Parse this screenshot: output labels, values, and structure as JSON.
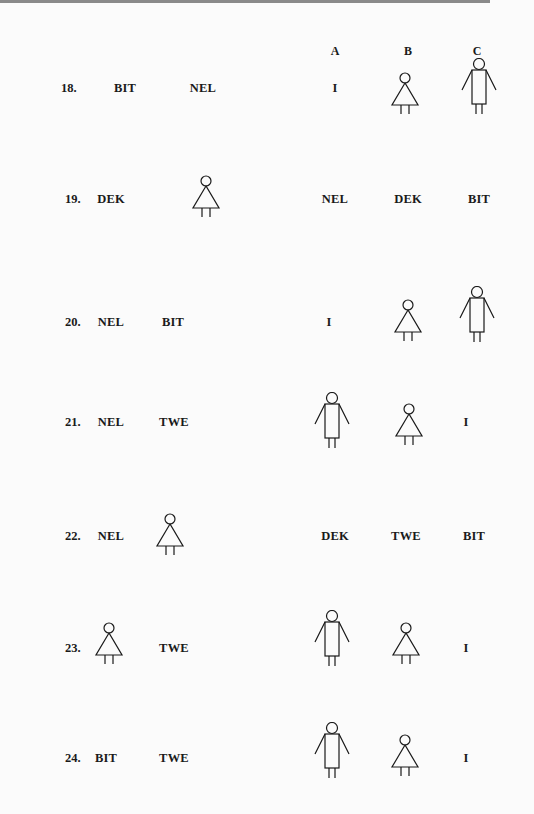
{
  "columns": [
    "A",
    "B",
    "C"
  ],
  "items": [
    {
      "number": "18.",
      "prompt": [
        {
          "type": "text",
          "value": "BIT"
        },
        {
          "type": "text",
          "value": "NEL"
        }
      ],
      "options": [
        {
          "type": "text",
          "value": "I"
        },
        {
          "type": "icon",
          "value": "female-figure"
        },
        {
          "type": "icon",
          "value": "male-figure"
        }
      ]
    },
    {
      "number": "19.",
      "prompt": [
        {
          "type": "text",
          "value": "DEK"
        },
        {
          "type": "icon",
          "value": "female-figure"
        }
      ],
      "options": [
        {
          "type": "text",
          "value": "NEL"
        },
        {
          "type": "text",
          "value": "DEK"
        },
        {
          "type": "text",
          "value": "BIT"
        }
      ]
    },
    {
      "number": "20.",
      "prompt": [
        {
          "type": "text",
          "value": "NEL"
        },
        {
          "type": "text",
          "value": "BIT"
        }
      ],
      "options": [
        {
          "type": "text",
          "value": "I"
        },
        {
          "type": "icon",
          "value": "female-figure"
        },
        {
          "type": "icon",
          "value": "male-figure"
        }
      ]
    },
    {
      "number": "21.",
      "prompt": [
        {
          "type": "text",
          "value": "NEL"
        },
        {
          "type": "text",
          "value": "TWE"
        }
      ],
      "options": [
        {
          "type": "icon",
          "value": "male-figure"
        },
        {
          "type": "icon",
          "value": "female-figure"
        },
        {
          "type": "text",
          "value": "I"
        }
      ]
    },
    {
      "number": "22.",
      "prompt": [
        {
          "type": "text",
          "value": "NEL"
        },
        {
          "type": "icon",
          "value": "female-figure"
        }
      ],
      "options": [
        {
          "type": "text",
          "value": "DEK"
        },
        {
          "type": "text",
          "value": "TWE"
        },
        {
          "type": "text",
          "value": "BIT"
        }
      ]
    },
    {
      "number": "23.",
      "prompt": [
        {
          "type": "icon",
          "value": "female-figure"
        },
        {
          "type": "text",
          "value": "TWE"
        }
      ],
      "options": [
        {
          "type": "icon",
          "value": "male-figure"
        },
        {
          "type": "icon",
          "value": "female-figure"
        },
        {
          "type": "text",
          "value": "I"
        }
      ]
    },
    {
      "number": "24.",
      "prompt": [
        {
          "type": "text",
          "value": "BIT"
        },
        {
          "type": "text",
          "value": "TWE"
        }
      ],
      "options": [
        {
          "type": "icon",
          "value": "male-figure"
        },
        {
          "type": "icon",
          "value": "female-figure"
        },
        {
          "type": "text",
          "value": "I"
        }
      ]
    }
  ],
  "colors": {
    "ink": "#1a1a1a",
    "paper": "#fbfbfb",
    "rule": "#8a8a8a"
  }
}
